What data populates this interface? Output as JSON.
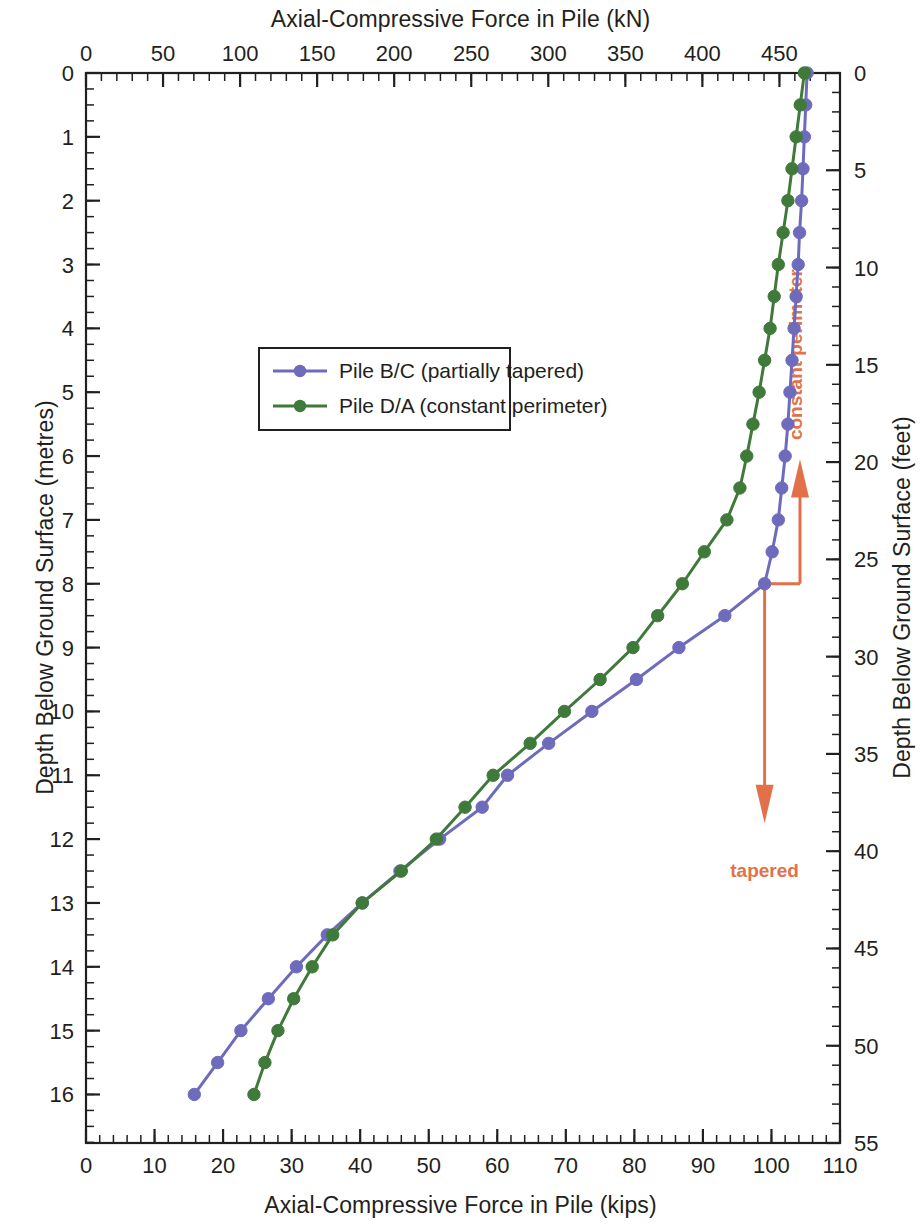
{
  "chart_data": {
    "type": "line",
    "title": "",
    "top_axis": {
      "label": "Axial-Compressive Force in Pile (kN)",
      "ticks": [
        0,
        50,
        100,
        150,
        200,
        250,
        300,
        350,
        400,
        450
      ],
      "range": [
        0,
        489.3
      ],
      "minor_step": 10
    },
    "bottom_axis": {
      "label": "Axial-Compressive Force in Pile (kips)",
      "ticks": [
        0,
        10,
        20,
        30,
        40,
        50,
        60,
        70,
        80,
        90,
        100,
        110
      ],
      "range": [
        0,
        110
      ],
      "minor_step": 2
    },
    "left_axis": {
      "label": "Depth Below Ground Surface (metres)",
      "ticks": [
        0,
        1,
        2,
        3,
        4,
        5,
        6,
        7,
        8,
        9,
        10,
        11,
        12,
        13,
        14,
        15,
        16
      ],
      "range": [
        0,
        16.76
      ],
      "minor_step": 0.25
    },
    "right_axis": {
      "label": "Depth Below Ground Surface (feet)",
      "ticks": [
        0,
        5,
        10,
        15,
        20,
        25,
        30,
        35,
        40,
        45,
        50,
        55
      ],
      "range": [
        0,
        55
      ],
      "minor_step": 1
    },
    "grid": false,
    "legend_position": "upper-left-inside",
    "series": [
      {
        "name": "Pile B/C (partially tapered)",
        "color": "#6e6bbd",
        "marker": "circle",
        "x_unit": "kips",
        "y_unit": "metres",
        "points": [
          [
            105.2,
            0.0
          ],
          [
            105.0,
            0.5
          ],
          [
            104.8,
            1.0
          ],
          [
            104.6,
            1.5
          ],
          [
            104.4,
            2.0
          ],
          [
            104.1,
            2.5
          ],
          [
            103.9,
            3.0
          ],
          [
            103.6,
            3.5
          ],
          [
            103.3,
            4.0
          ],
          [
            103.0,
            4.5
          ],
          [
            102.7,
            5.0
          ],
          [
            102.4,
            5.5
          ],
          [
            102.0,
            6.0
          ],
          [
            101.5,
            6.5
          ],
          [
            101.0,
            7.0
          ],
          [
            100.1,
            7.5
          ],
          [
            99.0,
            8.0
          ],
          [
            93.2,
            8.5
          ],
          [
            86.5,
            9.0
          ],
          [
            80.3,
            9.5
          ],
          [
            73.8,
            10.0
          ],
          [
            67.5,
            10.5
          ],
          [
            61.5,
            11.0
          ],
          [
            57.8,
            11.5
          ],
          [
            51.6,
            12.0
          ],
          [
            45.8,
            12.5
          ],
          [
            40.3,
            13.0
          ],
          [
            35.2,
            13.5
          ],
          [
            30.7,
            14.0
          ],
          [
            26.6,
            14.5
          ],
          [
            22.6,
            15.0
          ],
          [
            19.2,
            15.5
          ],
          [
            15.8,
            16.0
          ]
        ]
      },
      {
        "name": "Pile D/A (constant perimeter)",
        "color": "#3f7a3a",
        "marker": "circle",
        "x_unit": "kips",
        "y_unit": "metres",
        "points": [
          [
            104.8,
            0.0
          ],
          [
            104.2,
            0.5
          ],
          [
            103.6,
            1.0
          ],
          [
            103.0,
            1.5
          ],
          [
            102.4,
            2.0
          ],
          [
            101.7,
            2.5
          ],
          [
            101.0,
            3.0
          ],
          [
            100.4,
            3.5
          ],
          [
            99.8,
            4.0
          ],
          [
            99.0,
            4.5
          ],
          [
            98.2,
            5.0
          ],
          [
            97.3,
            5.5
          ],
          [
            96.4,
            6.0
          ],
          [
            95.4,
            6.5
          ],
          [
            93.5,
            7.0
          ],
          [
            90.2,
            7.5
          ],
          [
            87.0,
            8.0
          ],
          [
            83.4,
            8.5
          ],
          [
            79.8,
            9.0
          ],
          [
            75.0,
            9.5
          ],
          [
            69.8,
            10.0
          ],
          [
            64.8,
            10.5
          ],
          [
            59.4,
            11.0
          ],
          [
            55.3,
            11.5
          ],
          [
            51.1,
            12.0
          ],
          [
            46.0,
            12.5
          ],
          [
            40.3,
            13.0
          ],
          [
            36.0,
            13.5
          ],
          [
            33.0,
            14.0
          ],
          [
            30.3,
            14.5
          ],
          [
            28.0,
            15.0
          ],
          [
            26.1,
            15.5
          ],
          [
            24.5,
            16.0
          ]
        ]
      }
    ],
    "annotations": [
      {
        "text": "constant perimeter",
        "color": "#e2714a",
        "orientation": "vertical",
        "arrow": "up",
        "anchor_depth_m": 8.0
      },
      {
        "text": "tapered",
        "color": "#e2714a",
        "orientation": "horizontal",
        "arrow": "down",
        "anchor_depth_m": 8.0
      }
    ]
  },
  "legend": {
    "items": [
      {
        "label": "Pile B/C (partially tapered)",
        "color": "#6e6bbd"
      },
      {
        "label": "Pile D/A (constant perimeter)",
        "color": "#3f7a3a"
      }
    ]
  },
  "titles": {
    "top": "Axial-Compressive Force in Pile (kN)",
    "bottom": "Axial-Compressive Force in Pile (kips)",
    "left": "Depth Below Ground Surface (metres)",
    "right": "Depth Below Ground Surface (feet)"
  },
  "annotation_labels": {
    "constant_perimeter": "constant perimeter",
    "tapered": "tapered"
  },
  "colors": {
    "series_b_c": "#6e6bbd",
    "series_d_a": "#3f7a3a",
    "annotation": "#e2714a",
    "axis": "#231f20"
  }
}
